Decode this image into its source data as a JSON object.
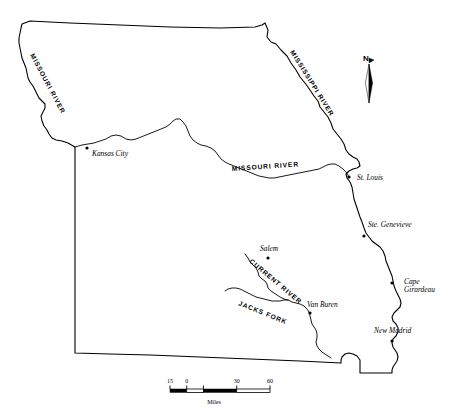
{
  "map": {
    "title": "Missouri state outline map",
    "region": "Missouri",
    "background_color": "#ffffff",
    "line_color": "#000000",
    "cities": [
      {
        "name": "Kansas City",
        "label_x": 92,
        "label_y": 156,
        "dot_x": 87,
        "dot_y": 148,
        "anchor": "start"
      },
      {
        "name": "St. Louis",
        "label_x": 357,
        "label_y": 180,
        "dot_x": 349,
        "dot_y": 177,
        "anchor": "start"
      },
      {
        "name": "Ste. Genevieve",
        "label_x": 368,
        "label_y": 227,
        "dot_x": 364,
        "dot_y": 236,
        "anchor": "start"
      },
      {
        "name": "Salem",
        "label_x": 260,
        "label_y": 251,
        "dot_x": 268,
        "dot_y": 258,
        "anchor": "start"
      },
      {
        "name": "Van Buren",
        "label_x": 307,
        "label_y": 307,
        "dot_x": 310,
        "dot_y": 313,
        "anchor": "start"
      },
      {
        "name": "New Madrid",
        "label_x": 374,
        "label_y": 333,
        "dot_x": 392,
        "dot_y": 341,
        "anchor": "start"
      }
    ],
    "city_two_line": [
      {
        "name_line1": "Cape",
        "name_line2": "Girardeau",
        "label_x": 404,
        "label_y": 284,
        "dot_x": 392,
        "dot_y": 283
      }
    ],
    "river_labels": [
      {
        "text": "MISSOURI RIVER",
        "x": 30,
        "y": 55,
        "rotate": 62,
        "name": "missouri-river-northwest"
      },
      {
        "text": "MISSISSIPPI RIVER",
        "x": 290,
        "y": 52,
        "rotate": 58,
        "name": "mississippi-river-northeast"
      },
      {
        "text": "MISSOURI RIVER",
        "x": 232,
        "y": 171,
        "rotate": -4,
        "name": "missouri-river-central"
      },
      {
        "text": "CURRENT RIVER",
        "x": 249,
        "y": 262,
        "rotate": 40,
        "name": "current-river"
      },
      {
        "text": "JACKS FORK",
        "x": 238,
        "y": 305,
        "rotate": 22,
        "name": "jacks-fork"
      }
    ],
    "compass": {
      "letter": "N",
      "letter_x": 369,
      "letter_y": 60,
      "needle_top_y": 64,
      "needle_bottom_y": 103,
      "needle_x": 369
    },
    "scale_bar": {
      "units": "Miles",
      "ticks": [
        "15",
        "0",
        "30",
        "60"
      ],
      "x_start": 170,
      "x_end": 270,
      "y": 391,
      "units_x": 214,
      "units_y": 404
    }
  }
}
